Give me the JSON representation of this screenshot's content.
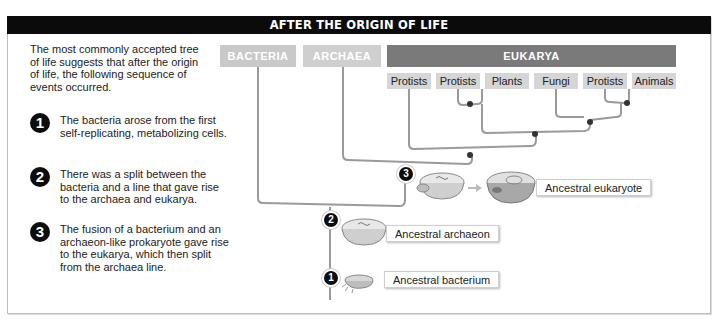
{
  "title": "AFTER THE ORIGIN OF LIFE",
  "intro": "The most commonly accepted tree of life suggests that after the origin of life, the following sequence of events occurred.",
  "steps": [
    {
      "number": "1",
      "text": "The bacteria arose from the first self-replicating, metabolizing cells."
    },
    {
      "number": "2",
      "text": "There was a split between the bacteria and a line that gave rise to the archaea and eukarya."
    },
    {
      "number": "3",
      "text": "The fusion of a bacterium and an archaeon-like prokaryote gave rise to the eukarya, which then split from the archaea line."
    }
  ],
  "domains": [
    {
      "label": "BACTERIA",
      "color": "#c9c9c9"
    },
    {
      "label": "ARCHAEA",
      "color": "#cfcfcf"
    },
    {
      "label": "EUKARYA",
      "color": "#7a7a7a"
    }
  ],
  "eukarya_groups": [
    "Protists",
    "Protists",
    "Plants",
    "Fungi",
    "Protists",
    "Animals"
  ],
  "cells": {
    "eukaryote": "Ancestral eukaryote",
    "archaeon": "Ancestral archaeon",
    "bacterium": "Ancestral bacterium"
  },
  "markers": [
    "1",
    "2",
    "3"
  ],
  "colors": {
    "titlebar": "#0b0b0b",
    "branch": "#9a9a9a",
    "node": "#333333"
  }
}
